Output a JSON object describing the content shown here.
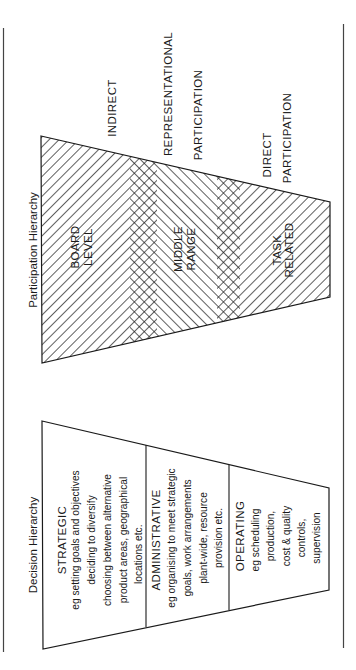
{
  "participation": {
    "title": "Participation Hierarchy",
    "levels": [
      {
        "line1": "BOARD",
        "line2": "LEVEL"
      },
      {
        "line1": "MIDDLE",
        "line2": "RANGE"
      },
      {
        "line1": "TASK",
        "line2": "RELATED"
      }
    ],
    "annotations": {
      "indirect": "INDIRECT",
      "representational_1": "REPRESENTATIONAL",
      "representational_2": "PARTICIPATION",
      "direct_1": "DIRECT",
      "direct_2": "PARTICIPATION"
    }
  },
  "decision": {
    "title": "Decision Hierarchy",
    "sections": [
      {
        "heading": "STRATEGIC",
        "lines": [
          "eg setting goals and objectives",
          "deciding to diversify",
          "choosing between alternative",
          "product areas, geographical",
          "locations etc."
        ]
      },
      {
        "heading": "ADMINISTRATIVE",
        "lines": [
          "eg organising to meet strategic",
          "goals, work arrangements",
          "plant-wide, resource",
          "provision etc."
        ]
      },
      {
        "heading": "OPERATING",
        "lines": [
          "eg scheduling",
          "production,",
          "cost & quality",
          "controls,",
          "supervision"
        ]
      }
    ]
  },
  "colors": {
    "ink": "#1a1a1a",
    "background": "#ffffff"
  }
}
